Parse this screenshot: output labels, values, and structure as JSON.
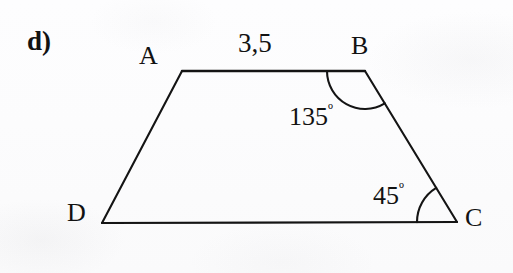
{
  "figure": {
    "item_marker": "d)",
    "shape_name": "trapezoid",
    "stroke_color": "#141414",
    "background_color": "#fdfdfd",
    "vertices": [
      {
        "name": "A",
        "label": "A",
        "x": 182,
        "y": 71,
        "label_x": 139,
        "label_y": 43
      },
      {
        "name": "B",
        "label": "B",
        "x": 365,
        "y": 71,
        "label_x": 351,
        "label_y": 33
      },
      {
        "name": "C",
        "label": "C",
        "x": 457,
        "y": 222,
        "label_x": 465,
        "label_y": 205
      },
      {
        "name": "D",
        "label": "D",
        "x": 102,
        "y": 223,
        "label_x": 67,
        "label_y": 200
      }
    ],
    "sides": [
      {
        "name": "AB",
        "from": "A",
        "to": "B",
        "length_label": "3,5"
      },
      {
        "name": "BC",
        "from": "B",
        "to": "C",
        "length_label": ""
      },
      {
        "name": "CD",
        "from": "C",
        "to": "D",
        "length_label": ""
      },
      {
        "name": "DA",
        "from": "D",
        "to": "A",
        "length_label": ""
      }
    ],
    "side_length_ab": "3,5",
    "angles": [
      {
        "at_vertex": "B",
        "value": "135",
        "unit": "º",
        "label": "135º",
        "arc_radius": 38
      },
      {
        "at_vertex": "C",
        "value": "45",
        "unit": "º",
        "label": "45º",
        "arc_radius": 40
      }
    ],
    "angle_b_value": "135",
    "angle_c_value": "45",
    "degree_symbol": "º"
  }
}
